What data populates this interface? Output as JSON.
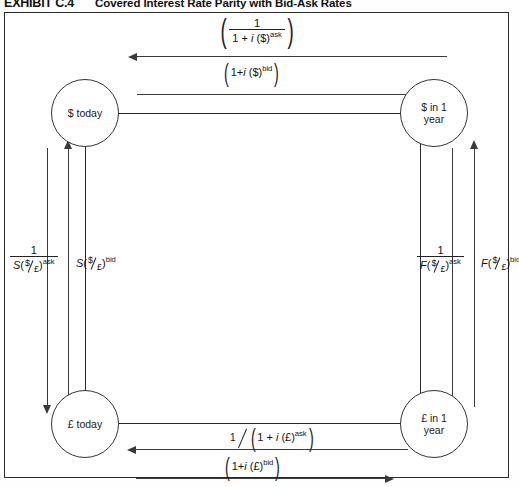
{
  "exhibit": {
    "label": "EXHIBIT C.4",
    "title": "Covered Interest Rate Parity with Bid-Ask Rates"
  },
  "nodes": {
    "dollar_today": "$ today",
    "dollar_future_line1": "$ in 1",
    "dollar_future_line2": "year",
    "pound_today": "£ today",
    "pound_future_line1": "£ in 1",
    "pound_future_line2": "year"
  },
  "formulas": {
    "top_outer": {
      "name": "dollar-ask-discount",
      "plain": "( 1 / (1 + i($)^ask) )",
      "numerator": "1",
      "den_pre": "1 + ",
      "den_i": "i",
      "den_cur": " ($)",
      "den_sup": "ask",
      "arrow": "left"
    },
    "top_inner": {
      "name": "dollar-bid-compound",
      "plain": "(1+i($)^bid)",
      "pre": "1+",
      "i": "i",
      "cur": " ($)",
      "sup": "bid",
      "arrow": "right"
    },
    "bottom_inner": {
      "name": "pound-ask-discount",
      "plain": "1 / (1 + i(£)^ask)",
      "numerator": "1",
      "den_pre": "1 + ",
      "den_i": "i",
      "den_cur": " (£)",
      "den_sup": "ask",
      "arrow": "left"
    },
    "bottom_outer": {
      "name": "pound-bid-compound",
      "plain": "(1+i(£)^bid)",
      "pre": "1+",
      "i": "i",
      "cur": " (£)",
      "sup": "bid",
      "arrow": "right"
    },
    "left_outer": {
      "name": "spot-ask-inverse",
      "plain": "1 / S($/£)^ask",
      "numerator": "1",
      "den_S": "S",
      "den_num": "$",
      "den_den": "£",
      "den_sup": "ask",
      "arrow": "down"
    },
    "left_inner": {
      "name": "spot-bid",
      "plain": "S($/£)^bid",
      "S": "S",
      "num": "$",
      "den": "£",
      "sup": "bid",
      "arrow": "up"
    },
    "right_inner": {
      "name": "forward-ask-inverse",
      "plain": "1 / F($/£)^ask",
      "numerator": "1",
      "den_S": "F",
      "den_num": "$",
      "den_den": "£",
      "den_sup": "ask",
      "arrow": "down"
    },
    "right_outer": {
      "name": "forward-bid",
      "plain": "F($/£)^bid",
      "S": "F",
      "num": "$",
      "den": "£",
      "sup": "bid",
      "arrow": "up"
    }
  },
  "colors": {
    "line": "#3a3a3a",
    "frame": "#2b2b2b",
    "text": "#111111",
    "background": "#ffffff"
  }
}
